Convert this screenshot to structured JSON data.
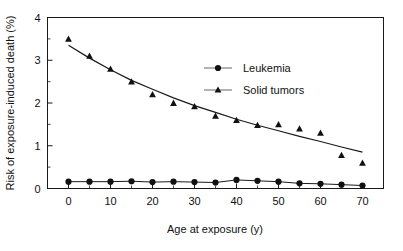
{
  "chart_data": {
    "type": "scatter",
    "title": "",
    "xlabel": "Age at exposure (y)",
    "ylabel": "Risk of exposure-induced death (%)",
    "xlim": [
      -5,
      75
    ],
    "ylim": [
      0,
      4
    ],
    "xticks": [
      0,
      10,
      20,
      30,
      40,
      50,
      60,
      70
    ],
    "xtick_labels": [
      "0",
      "10",
      "20",
      "30",
      "40",
      "50",
      "60",
      "70"
    ],
    "xminor_ticks": [
      5,
      15,
      25,
      35,
      45,
      55,
      65
    ],
    "yticks": [
      0,
      1,
      2,
      3,
      4
    ],
    "ytick_labels": [
      "0",
      "1",
      "2",
      "3",
      "4"
    ],
    "yminor_ticks": [
      0.5,
      1.5,
      2.5,
      3.5
    ],
    "grid": false,
    "legend_position": "upper-center-right",
    "x": [
      0,
      5,
      10,
      15,
      20,
      25,
      30,
      35,
      40,
      45,
      50,
      55,
      60,
      65,
      70
    ],
    "series": [
      {
        "name": "Leukemia",
        "marker": "circle",
        "has_line": true,
        "values": [
          0.16,
          0.16,
          0.16,
          0.17,
          0.15,
          0.16,
          0.15,
          0.14,
          0.2,
          0.18,
          0.16,
          0.12,
          0.11,
          0.09,
          0.07
        ]
      },
      {
        "name": "Solid tumors",
        "marker": "triangle",
        "has_line": false,
        "has_fit_curve": true,
        "values": [
          3.5,
          3.1,
          2.8,
          2.5,
          2.2,
          2.0,
          1.92,
          1.7,
          1.6,
          1.48,
          1.5,
          1.4,
          1.3,
          0.78,
          0.6
        ],
        "fit_curve": [
          [
            0,
            3.35
          ],
          [
            5,
            3.05
          ],
          [
            10,
            2.78
          ],
          [
            15,
            2.53
          ],
          [
            20,
            2.32
          ],
          [
            25,
            2.12
          ],
          [
            30,
            1.94
          ],
          [
            35,
            1.78
          ],
          [
            40,
            1.62
          ],
          [
            45,
            1.48
          ],
          [
            50,
            1.35
          ],
          [
            55,
            1.22
          ],
          [
            60,
            1.1
          ],
          [
            65,
            0.97
          ],
          [
            70,
            0.85
          ]
        ]
      }
    ]
  },
  "legend": {
    "items": [
      {
        "label": "Leukemia",
        "marker": "circle"
      },
      {
        "label": "Solid tumors",
        "marker": "triangle"
      }
    ]
  },
  "axes": {
    "x_title": "Age at exposure (y)",
    "y_title": "Risk of exposure-induced death (%)"
  }
}
